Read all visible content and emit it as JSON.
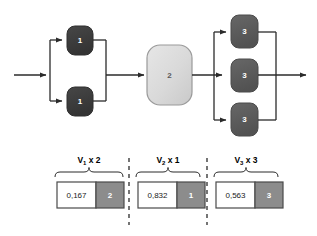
{
  "diagram": {
    "colors": {
      "node_stage1": "#3d3d3d",
      "node_stage2_light": "#d8d8d8",
      "node_stage2_border": "#9a9a9a",
      "node_stage3": "#5c5c5c",
      "line": "#2b2b2b",
      "value_fill": "#8c8c8c",
      "box_border": "#4a4a4a",
      "background": "#ffffff"
    },
    "stages": [
      {
        "id": "stage-1",
        "parallel_count": 2,
        "nodes": [
          {
            "label": "1"
          },
          {
            "label": "1"
          }
        ]
      },
      {
        "id": "stage-2",
        "parallel_count": 1,
        "nodes": [
          {
            "label": "2"
          }
        ]
      },
      {
        "id": "stage-3",
        "parallel_count": 3,
        "nodes": [
          {
            "label": "3"
          },
          {
            "label": "3"
          },
          {
            "label": "3"
          }
        ]
      }
    ]
  },
  "legend": {
    "groups": [
      {
        "id": "group-v1",
        "label_prefix": "V",
        "label_sub": "1",
        "label_suffix": " x 2",
        "value": "0,167",
        "count": "2"
      },
      {
        "id": "group-v2",
        "label_prefix": "V",
        "label_sub": "2",
        "label_suffix": " x 1",
        "value": "0,832",
        "count": "1"
      },
      {
        "id": "group-v3",
        "label_prefix": "V",
        "label_sub": "3",
        "label_suffix": " x 3",
        "value": "0,563",
        "count": "3"
      }
    ]
  }
}
